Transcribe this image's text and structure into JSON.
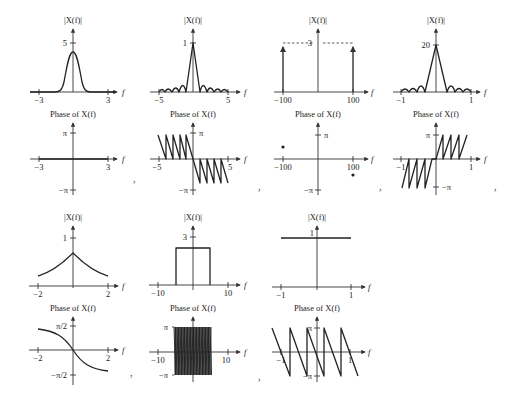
{
  "figure": {
    "separator": ","
  },
  "plots": [
    {
      "id": "p1",
      "magnitude": {
        "title": "|X(f)|",
        "xticks": [
          "−3",
          "3"
        ],
        "yticks": [
          "5"
        ],
        "xlabel": "f",
        "shape": "gaussian"
      },
      "phase": {
        "title": "Phase of X(f)",
        "xticks": [
          "−3",
          "3"
        ],
        "yticks": [
          "π",
          "−π"
        ],
        "xlabel": "f",
        "shape": "zero"
      }
    },
    {
      "id": "p2",
      "magnitude": {
        "title": "|X(f)|",
        "xticks": [
          "−5",
          "5"
        ],
        "yticks": [
          "1"
        ],
        "xlabel": "f",
        "shape": "abs-sinc"
      },
      "phase": {
        "title": "Phase of X(f)",
        "xticks": [
          "−5",
          "5"
        ],
        "yticks": [
          "π",
          "−π"
        ],
        "xlabel": "f",
        "shape": "sawtooth-decreasing"
      }
    },
    {
      "id": "p3",
      "magnitude": {
        "title": "|X(f)|",
        "xticks": [
          "−100",
          "100"
        ],
        "yticks": [
          "3"
        ],
        "xlabel": "f",
        "shape": "impulses at -100, 0, 100"
      },
      "phase": {
        "title": "Phase of X(f)",
        "xticks": [
          "−100",
          "100"
        ],
        "yticks": [
          "π",
          "−π"
        ],
        "xlabel": "f",
        "shape": "points at ±100"
      }
    },
    {
      "id": "p4",
      "magnitude": {
        "title": "|X(f)|",
        "xticks": [
          "−1",
          "1"
        ],
        "yticks": [
          "20"
        ],
        "xlabel": "f",
        "shape": "abs-sinc"
      },
      "phase": {
        "title": "Phase of X(f)",
        "xticks": [
          "−1",
          "1"
        ],
        "yticks": [
          "π",
          "−π"
        ],
        "xlabel": "f",
        "shape": "sawtooth-increasing"
      }
    },
    {
      "id": "p5",
      "magnitude": {
        "title": "|X(f)|",
        "xticks": [
          "−2",
          "2"
        ],
        "yticks": [
          "1"
        ],
        "xlabel": "f",
        "shape": "lorentzian"
      },
      "phase": {
        "title": "Phase of X(f)",
        "xticks": [
          "−2",
          "2"
        ],
        "yticks": [
          "π/2",
          "−π/2"
        ],
        "xlabel": "f",
        "shape": "-arctan"
      }
    },
    {
      "id": "p6",
      "magnitude": {
        "title": "|X(f)|",
        "xticks": [
          "−10",
          "10"
        ],
        "yticks": [
          "3"
        ],
        "xlabel": "f",
        "shape": "rect"
      },
      "phase": {
        "title": "Phase of X(f)",
        "xticks": [
          "−10",
          "10"
        ],
        "yticks": [
          "π",
          "−π"
        ],
        "xlabel": "f",
        "shape": "dense-sawtooth"
      }
    },
    {
      "id": "p7",
      "magnitude": {
        "title": "|X(f)|",
        "xticks": [
          "−1",
          "1"
        ],
        "yticks": [
          "1"
        ],
        "xlabel": "f",
        "shape": "constant"
      },
      "phase": {
        "title": "Phase of X(f)",
        "xticks": [
          "−1",
          "1"
        ],
        "yticks": [
          "π",
          "−π"
        ],
        "xlabel": "f",
        "shape": "sawtooth-decreasing"
      }
    }
  ]
}
